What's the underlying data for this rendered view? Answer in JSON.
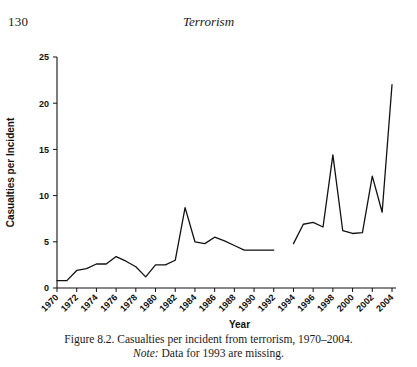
{
  "page": {
    "folio": "130",
    "running_head": "Terrorism"
  },
  "caption": {
    "line1": "Figure 8.2.  Casualties per incident from terrorism, 1970–2004.",
    "note_label": "Note:",
    "note_text": " Data for 1993 are missing."
  },
  "chart_data": {
    "type": "line",
    "title": "",
    "xlabel": "Year",
    "ylabel": "Casualties per Incident",
    "xlim": [
      1970,
      2004
    ],
    "ylim": [
      0,
      25
    ],
    "grid": false,
    "legend": null,
    "ytick_labels": [
      "0",
      "5",
      "10",
      "15",
      "20",
      "25"
    ],
    "ytick_values": [
      0,
      5,
      10,
      15,
      20,
      25
    ],
    "xtick_labels": [
      "1970",
      "1972",
      "1974",
      "1976",
      "1978",
      "1980",
      "1982",
      "1984",
      "1986",
      "1988",
      "1990",
      "1992",
      "1994",
      "1996",
      "1998",
      "2000",
      "2002",
      "2004"
    ],
    "xtick_values": [
      1970,
      1972,
      1974,
      1976,
      1978,
      1980,
      1982,
      1984,
      1986,
      1988,
      1990,
      1992,
      1994,
      1996,
      1998,
      2000,
      2002,
      2004
    ],
    "annotations": [
      "Data for 1993 are missing"
    ],
    "series": [
      {
        "name": "Casualties per incident",
        "color": "#111111",
        "x": [
          1970,
          1971,
          1972,
          1973,
          1974,
          1975,
          1976,
          1977,
          1978,
          1979,
          1980,
          1981,
          1982,
          1983,
          1984,
          1985,
          1986,
          1987,
          1988,
          1989,
          1990,
          1991,
          1992
        ],
        "values": [
          0.8,
          0.8,
          1.9,
          2.1,
          2.6,
          2.6,
          3.4,
          2.9,
          2.3,
          1.2,
          2.5,
          2.5,
          3.0,
          8.7,
          5.0,
          4.8,
          5.5,
          5.1,
          4.6,
          4.1,
          4.1,
          4.1,
          4.1
        ]
      },
      {
        "name": "Casualties per incident (post-1993)",
        "color": "#111111",
        "x": [
          1994,
          1995,
          1996,
          1997,
          1998,
          1999,
          2000,
          2001,
          2002,
          2003,
          2004
        ],
        "values": [
          4.8,
          6.9,
          7.1,
          6.6,
          14.4,
          6.2,
          5.9,
          6.0,
          12.1,
          8.2,
          22.0
        ]
      }
    ]
  }
}
